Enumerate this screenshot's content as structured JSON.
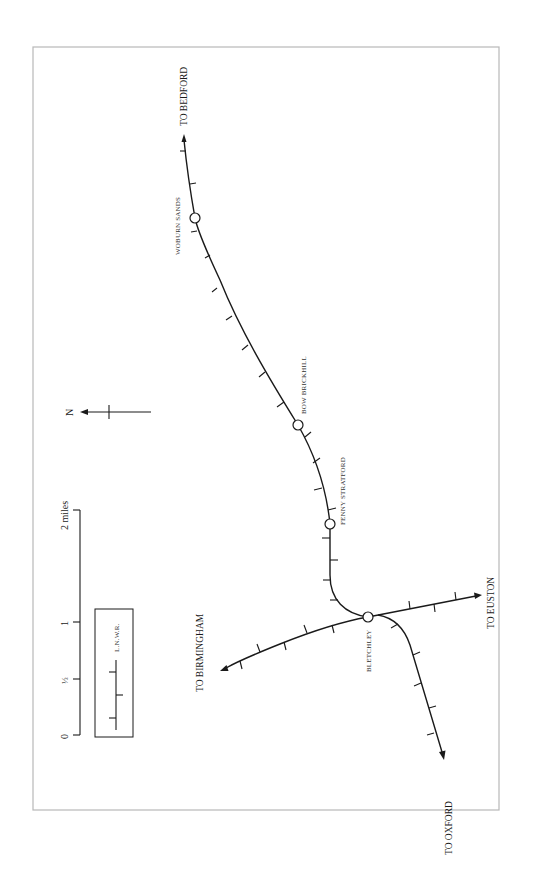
{
  "map": {
    "title": "Railway map around Bletchley (LNWR)",
    "orientation": "rotated 90 degrees counter-clockwise; north points left",
    "colors": {
      "line": "#1a1a1a",
      "frame": "#b8b8b8",
      "background": "#ffffff",
      "label": "#333333"
    },
    "stations": [
      {
        "id": "woburn-sands",
        "name": "WOBURN SANDS"
      },
      {
        "id": "bow-brickhill",
        "name": "BOW BRICKHILL"
      },
      {
        "id": "fenny-stratford",
        "name": "FENNY STRATFORD"
      },
      {
        "id": "bletchley",
        "name": "BLETCHLEY"
      }
    ],
    "destinations": [
      {
        "id": "bedford",
        "label": "TO BEDFORD"
      },
      {
        "id": "euston",
        "label": "TO EUSTON"
      },
      {
        "id": "oxford",
        "label": "TO OXFORD"
      },
      {
        "id": "birmingham",
        "label": "TO BIRMINGHAM"
      }
    ],
    "north_arrow": {
      "label": "N"
    },
    "scale_bar": {
      "unit_label": "2 miles",
      "ticks": [
        "0",
        "½",
        "1",
        "2 miles"
      ],
      "tick_0": "0",
      "tick_half": "½",
      "tick_1": "1",
      "tick_2": "2 miles"
    },
    "legend": {
      "items": [
        {
          "symbol": "line-with-alternating-ticks",
          "label": "L.N.W.R."
        }
      ],
      "label": "L.N.W.R."
    }
  }
}
